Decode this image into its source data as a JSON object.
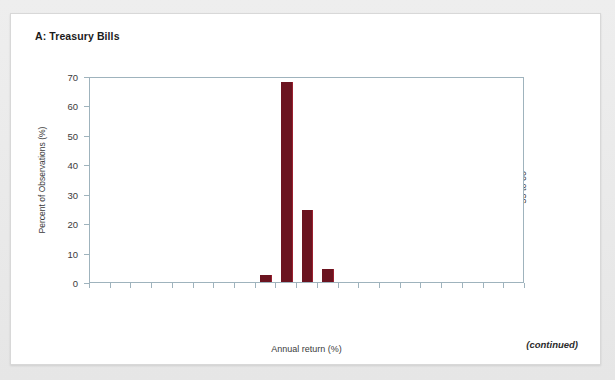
{
  "panel": {
    "title": "A: Treasury Bills",
    "footnote": "(continued)"
  },
  "chart_data": {
    "type": "bar",
    "title": "A: Treasury Bills",
    "xlabel": "Annual return (%)",
    "ylabel": "Percent of Observations (%)",
    "ylim": [
      0,
      70
    ],
    "yticks": [
      0,
      10,
      20,
      30,
      40,
      50,
      60,
      70
    ],
    "grid": false,
    "legend": null,
    "bar_color": "#6b1420",
    "categories": [
      "−45 to −40",
      "−40 to −35",
      "−35 to −30",
      "−30 to −25",
      "−25 to −20",
      "−20 to −15",
      "−15 to −10",
      "−10 to −5",
      "−5 to 0",
      "0 to 5",
      "5 to 10",
      "10 to 15",
      "15 to 20",
      "20 to 25",
      "25 to 30",
      "30 to 35",
      "35 to 40",
      "40 to 45",
      "45 to 50",
      "50 to 55",
      "55 to 60"
    ],
    "values": [
      0,
      0,
      0,
      0,
      0,
      0,
      0,
      0,
      2.5,
      68,
      24.5,
      4.5,
      0,
      0,
      0,
      0,
      0,
      0,
      0,
      0,
      0
    ]
  }
}
